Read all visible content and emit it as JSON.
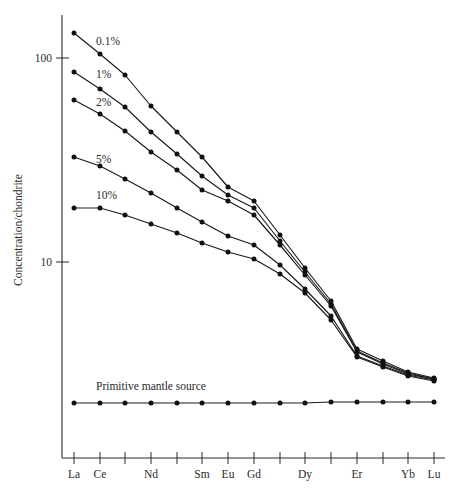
{
  "chart_data": {
    "type": "line",
    "title": "",
    "subtitle": "",
    "xlabel": "",
    "ylabel": "Concentration/chondrite",
    "yscale": "log",
    "ylim": [
      2,
      200
    ],
    "ytick_labels": [
      "100",
      "10"
    ],
    "ytick_values": [
      100,
      10
    ],
    "grid": false,
    "legend_position": "inline-labels",
    "x": [
      "La",
      "Ce",
      "Pr",
      "Nd",
      "Pm",
      "Sm",
      "Eu",
      "Gd",
      "Tb",
      "Dy",
      "Ho",
      "Er",
      "Tm",
      "Yb",
      "Lu"
    ],
    "xtick_labels": [
      "La",
      "Ce",
      "",
      "Nd",
      "",
      "Sm",
      "Eu",
      "Gd",
      "",
      "Dy",
      "",
      "Er",
      "",
      "Yb",
      "Lu"
    ],
    "categories": [
      "La",
      "Ce",
      "Pr",
      "Nd",
      "Pm",
      "Sm",
      "Eu",
      "Gd",
      "Tb",
      "Dy",
      "Ho",
      "Er",
      "Tm",
      "Yb",
      "Lu"
    ],
    "series": [
      {
        "name": "0.1%",
        "label": "0.1%",
        "label_position": {
          "x": 96,
          "y": 45
        },
        "marker": "filled-circle",
        "values": [
          138,
          98,
          70,
          50,
          37,
          28,
          22,
          19,
          13.5,
          9.4,
          6.5,
          4.5,
          4.0,
          3.6,
          3.4
        ],
        "points_px": [
          {
            "x": 74,
            "y": 33
          },
          {
            "x": 100,
            "y": 54
          },
          {
            "x": 125,
            "y": 75
          },
          {
            "x": 151,
            "y": 106
          },
          {
            "x": 177,
            "y": 132
          },
          {
            "x": 202,
            "y": 157
          },
          {
            "x": 228,
            "y": 187
          },
          {
            "x": 254,
            "y": 201
          },
          {
            "x": 280,
            "y": 235
          },
          {
            "x": 305,
            "y": 268
          },
          {
            "x": 331,
            "y": 301
          },
          {
            "x": 357,
            "y": 349
          },
          {
            "x": 383,
            "y": 361
          },
          {
            "x": 408,
            "y": 372
          },
          {
            "x": 434,
            "y": 378
          }
        ]
      },
      {
        "name": "1%",
        "label": "1%",
        "label_position": {
          "x": 96,
          "y": 78
        },
        "marker": "filled-circle",
        "values": [
          86,
          67,
          53,
          40,
          31,
          24,
          19.5,
          17,
          12.5,
          9.0,
          6.3,
          4.4,
          3.9,
          3.5,
          3.3
        ],
        "points_px": [
          {
            "x": 74,
            "y": 72
          },
          {
            "x": 100,
            "y": 89
          },
          {
            "x": 125,
            "y": 107
          },
          {
            "x": 151,
            "y": 132
          },
          {
            "x": 177,
            "y": 154
          },
          {
            "x": 202,
            "y": 176
          },
          {
            "x": 228,
            "y": 195
          },
          {
            "x": 254,
            "y": 208
          },
          {
            "x": 280,
            "y": 241
          },
          {
            "x": 305,
            "y": 272
          },
          {
            "x": 331,
            "y": 304
          },
          {
            "x": 357,
            "y": 351
          },
          {
            "x": 383,
            "y": 363
          },
          {
            "x": 408,
            "y": 373
          },
          {
            "x": 434,
            "y": 379
          }
        ]
      },
      {
        "name": "2%",
        "label": "2%",
        "label_position": {
          "x": 96,
          "y": 106
        },
        "marker": "filled-circle",
        "values": [
          66,
          55,
          45,
          35,
          28,
          22,
          18.5,
          16,
          12,
          8.8,
          6.2,
          4.35,
          3.85,
          3.5,
          3.3
        ],
        "points_px": [
          {
            "x": 74,
            "y": 100
          },
          {
            "x": 100,
            "y": 114
          },
          {
            "x": 125,
            "y": 131
          },
          {
            "x": 151,
            "y": 152
          },
          {
            "x": 177,
            "y": 170
          },
          {
            "x": 202,
            "y": 190
          },
          {
            "x": 228,
            "y": 201
          },
          {
            "x": 254,
            "y": 215
          },
          {
            "x": 280,
            "y": 245
          },
          {
            "x": 305,
            "y": 275
          },
          {
            "x": 331,
            "y": 306
          },
          {
            "x": 357,
            "y": 352
          },
          {
            "x": 383,
            "y": 364
          },
          {
            "x": 408,
            "y": 374
          },
          {
            "x": 434,
            "y": 379
          }
        ]
      },
      {
        "name": "5%",
        "label": "5%",
        "label_position": {
          "x": 96,
          "y": 163
        },
        "marker": "filled-circle",
        "values": [
          36,
          32,
          28,
          24,
          20.5,
          17.5,
          15,
          13.5,
          10.8,
          8.2,
          5.9,
          4.25,
          3.8,
          3.45,
          3.25
        ],
        "points_px": [
          {
            "x": 74,
            "y": 157
          },
          {
            "x": 100,
            "y": 166
          },
          {
            "x": 125,
            "y": 179
          },
          {
            "x": 151,
            "y": 193
          },
          {
            "x": 177,
            "y": 208
          },
          {
            "x": 202,
            "y": 222
          },
          {
            "x": 228,
            "y": 236
          },
          {
            "x": 254,
            "y": 245
          },
          {
            "x": 280,
            "y": 265
          },
          {
            "x": 305,
            "y": 289
          },
          {
            "x": 331,
            "y": 316
          },
          {
            "x": 357,
            "y": 356
          },
          {
            "x": 383,
            "y": 366
          },
          {
            "x": 408,
            "y": 375
          },
          {
            "x": 434,
            "y": 380
          }
        ]
      },
      {
        "name": "10%",
        "label": "10%",
        "label_position": {
          "x": 96,
          "y": 199
        },
        "marker": "filled-circle",
        "values": [
          19,
          19,
          17.5,
          16,
          14.5,
          13,
          11.8,
          11,
          9.3,
          7.5,
          5.6,
          4.15,
          3.75,
          3.4,
          3.2
        ],
        "points_px": [
          {
            "x": 74,
            "y": 208
          },
          {
            "x": 100,
            "y": 208
          },
          {
            "x": 125,
            "y": 215
          },
          {
            "x": 151,
            "y": 224
          },
          {
            "x": 177,
            "y": 233
          },
          {
            "x": 202,
            "y": 243
          },
          {
            "x": 228,
            "y": 252
          },
          {
            "x": 254,
            "y": 259
          },
          {
            "x": 280,
            "y": 274
          },
          {
            "x": 305,
            "y": 293
          },
          {
            "x": 331,
            "y": 320
          },
          {
            "x": 357,
            "y": 357
          },
          {
            "x": 383,
            "y": 367
          },
          {
            "x": 408,
            "y": 376
          },
          {
            "x": 434,
            "y": 381
          }
        ]
      },
      {
        "name": "Primitive mantle source",
        "label": "Primitive mantle source",
        "label_position": {
          "x": 96,
          "y": 390
        },
        "marker": "filled-circle",
        "values": [
          3.0,
          3.0,
          3.0,
          3.0,
          3.0,
          3.0,
          3.0,
          3.0,
          3.0,
          3.0,
          3.0,
          3.0,
          3.0,
          3.0,
          3.0
        ],
        "points_px": [
          {
            "x": 74,
            "y": 403
          },
          {
            "x": 100,
            "y": 403
          },
          {
            "x": 125,
            "y": 403
          },
          {
            "x": 151,
            "y": 403
          },
          {
            "x": 177,
            "y": 403
          },
          {
            "x": 202,
            "y": 403
          },
          {
            "x": 228,
            "y": 403
          },
          {
            "x": 254,
            "y": 403
          },
          {
            "x": 280,
            "y": 403
          },
          {
            "x": 305,
            "y": 403
          },
          {
            "x": 331,
            "y": 402
          },
          {
            "x": 357,
            "y": 402
          },
          {
            "x": 383,
            "y": 402
          },
          {
            "x": 408,
            "y": 402
          },
          {
            "x": 434,
            "y": 402
          }
        ]
      }
    ],
    "annotations": [
      {
        "text": "0.1%",
        "x": 96,
        "y": 45
      },
      {
        "text": "1%",
        "x": 96,
        "y": 78
      },
      {
        "text": "2%",
        "x": 96,
        "y": 106
      },
      {
        "text": "5%",
        "x": 96,
        "y": 163
      },
      {
        "text": "10%",
        "x": 96,
        "y": 199
      },
      {
        "text": "Primitive mantle source",
        "x": 96,
        "y": 390
      }
    ],
    "colors": {
      "line": "#1a1a1a",
      "marker": "#111111",
      "axis": "#2b2b2b",
      "background": "#ffffff"
    }
  },
  "axes": {
    "y_label": "Concentration/chondrite",
    "y_ticks": [
      {
        "label": "100",
        "y": 58
      },
      {
        "label": "10",
        "y": 262
      }
    ],
    "x_ticks": [
      {
        "label": "La",
        "x": 74
      },
      {
        "label": "Ce",
        "x": 100
      },
      {
        "label": "",
        "x": 125
      },
      {
        "label": "Nd",
        "x": 151
      },
      {
        "label": "",
        "x": 177
      },
      {
        "label": "Sm",
        "x": 202
      },
      {
        "label": "Eu",
        "x": 228
      },
      {
        "label": "Gd",
        "x": 254
      },
      {
        "label": "",
        "x": 280
      },
      {
        "label": "Dy",
        "x": 305
      },
      {
        "label": "",
        "x": 331
      },
      {
        "label": "Er",
        "x": 357
      },
      {
        "label": "",
        "x": 383
      },
      {
        "label": "Yb",
        "x": 408
      },
      {
        "label": "Lu",
        "x": 434
      }
    ]
  }
}
